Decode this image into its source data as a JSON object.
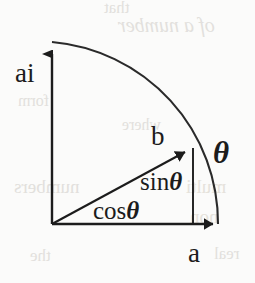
{
  "figure": {
    "background_color": "#fbfbfa",
    "ink_color": "#1c1c1c",
    "width": 255,
    "height": 283
  },
  "axes": {
    "vertical": {
      "label": "ai",
      "name": "imaginary-axis",
      "origin": [
        52,
        224
      ],
      "tip": [
        52,
        42
      ]
    },
    "horizontal": {
      "label": "a",
      "name": "real-axis",
      "origin": [
        52,
        224
      ],
      "tip": [
        225,
        224
      ]
    }
  },
  "arc": {
    "name": "unit-circle-arc",
    "start": [
      52,
      42
    ],
    "end": [
      218,
      224
    ],
    "radius": 182,
    "sweep_degrees": 90
  },
  "vector": {
    "label": "b",
    "name": "unit-vector-b",
    "start": [
      52,
      224
    ],
    "tip": [
      193,
      148
    ]
  },
  "projections": {
    "vertical_drop": {
      "label": "sinθ",
      "function": "sin",
      "symbol": "θ",
      "from": [
        193,
        148
      ],
      "to": [
        193,
        224
      ]
    },
    "horizontal_leg": {
      "label": "cosθ",
      "function": "cos",
      "symbol": "θ",
      "from": [
        52,
        224
      ],
      "to": [
        193,
        224
      ]
    }
  },
  "angle": {
    "label": "θ",
    "name": "angle-theta"
  },
  "bleed_through": {
    "note": "faint mirrored text showing through from the reverse page side",
    "fragments": [
      "that",
      "of a number",
      "form",
      "where",
      "numbers",
      "multi",
      "non",
      "the",
      "real"
    ]
  }
}
